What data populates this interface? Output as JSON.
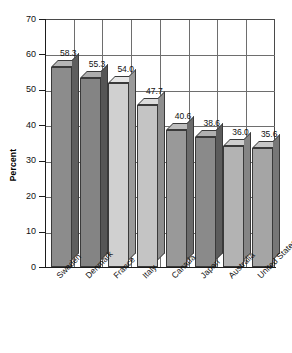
{
  "chart_data": {
    "type": "bar",
    "title": "",
    "subtitle": "",
    "xlabel": "",
    "ylabel": "Percent",
    "ylim": [
      0,
      70
    ],
    "ytick_step": 10,
    "yticks": [
      0,
      10,
      20,
      30,
      40,
      50,
      60,
      70
    ],
    "grid": true,
    "legend": "none",
    "value_label_format": "one-decimal",
    "style": "3d-column",
    "categories": [
      "Sweden",
      "Denmark",
      "France",
      "Italy",
      "Canada",
      "Japan",
      "Australia",
      "United States"
    ],
    "values": [
      58.3,
      55.3,
      54.0,
      47.7,
      40.6,
      38.6,
      36.0,
      35.6
    ],
    "value_labels": [
      "58.3",
      "55.3",
      "54.0",
      "47.7",
      "40.6",
      "38.6",
      "36.0",
      "35.6"
    ],
    "bar_face_colors": [
      "#8c8c8c",
      "#848484",
      "#d0d0d0",
      "#c4c4c4",
      "#999999",
      "#8a8a8a",
      "#b3b3b3",
      "#a5a5a5"
    ],
    "bar_top_colors": [
      "#b5b5b5",
      "#adadad",
      "#e6e6e6",
      "#dcdcdc",
      "#bdbdbd",
      "#b0b0b0",
      "#cfcfcf",
      "#c6c6c6"
    ],
    "bar_side_colors": [
      "#5e5e5e",
      "#565656",
      "#9a9a9a",
      "#8e8e8e",
      "#6b6b6b",
      "#5c5c5c",
      "#858585",
      "#777777"
    ]
  },
  "axes": {
    "y_title": "Percent",
    "y_tick_labels": [
      "70",
      "60",
      "50",
      "40",
      "30",
      "20",
      "10",
      "0"
    ]
  },
  "colors": {
    "background": "#ffffff",
    "axis": "#1d1d1d",
    "grid": "#6e6e6e",
    "text": "#111111"
  }
}
